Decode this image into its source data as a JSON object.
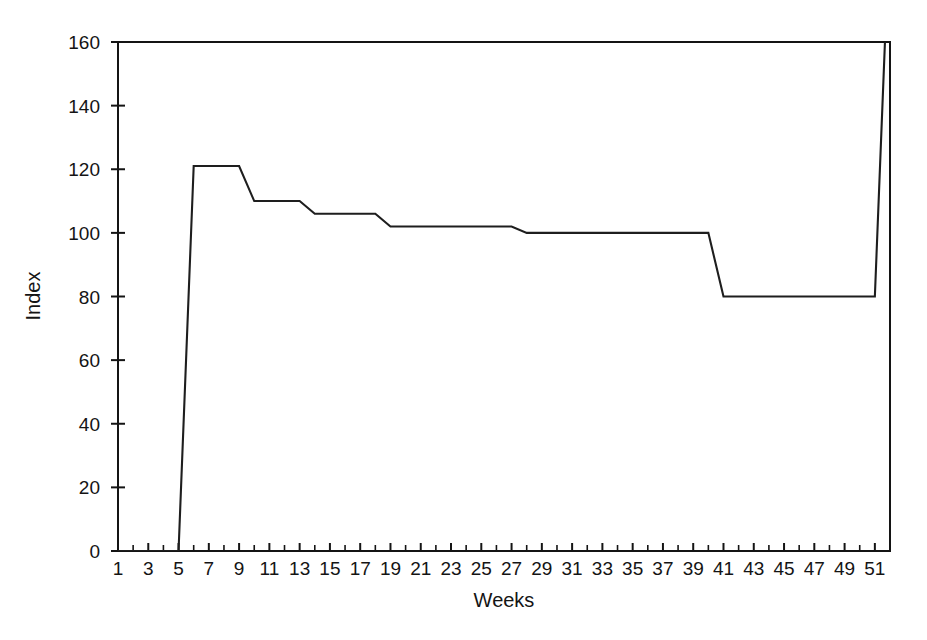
{
  "chart_data": {
    "type": "line",
    "title": "",
    "xlabel": "Weeks",
    "ylabel": "Index",
    "xlim": [
      1,
      52
    ],
    "ylim": [
      0,
      160
    ],
    "grid": false,
    "legend": null,
    "y_ticks": [
      0,
      20,
      40,
      60,
      80,
      100,
      120,
      140,
      160
    ],
    "y_tick_labels": [
      "0",
      "20",
      "40",
      "60",
      "80",
      "100",
      "120",
      "140",
      "160"
    ],
    "x_ticks": [
      1,
      2,
      3,
      4,
      5,
      6,
      7,
      8,
      9,
      10,
      11,
      12,
      13,
      14,
      15,
      16,
      17,
      18,
      19,
      20,
      21,
      22,
      23,
      24,
      25,
      26,
      27,
      28,
      29,
      30,
      31,
      32,
      33,
      34,
      35,
      36,
      37,
      38,
      39,
      40,
      41,
      42,
      43,
      44,
      45,
      46,
      47,
      48,
      49,
      50,
      51,
      52
    ],
    "x_tick_labels": [
      "1",
      "3",
      "5",
      "7",
      "9",
      "11",
      "13",
      "15",
      "17",
      "19",
      "21",
      "23",
      "25",
      "27",
      "29",
      "31",
      "33",
      "35",
      "37",
      "39",
      "41",
      "43",
      "45",
      "47",
      "49",
      "51"
    ],
    "x_labeled_ticks": [
      1,
      3,
      5,
      7,
      9,
      11,
      13,
      15,
      17,
      19,
      21,
      23,
      25,
      27,
      29,
      31,
      33,
      35,
      37,
      39,
      41,
      43,
      45,
      47,
      49,
      51
    ],
    "series": [
      {
        "name": "Index",
        "color": "#1e1e1e",
        "x": [
          1,
          2,
          3,
          4,
          5,
          6,
          7,
          8,
          9,
          10,
          11,
          12,
          13,
          14,
          15,
          16,
          17,
          18,
          19,
          20,
          21,
          22,
          23,
          24,
          25,
          26,
          27,
          28,
          29,
          30,
          31,
          32,
          33,
          34,
          35,
          36,
          37,
          38,
          39,
          40,
          41,
          42,
          43,
          44,
          45,
          46,
          47,
          48,
          49,
          50,
          51,
          52
        ],
        "values": [
          0,
          0,
          0,
          0,
          0,
          121,
          121,
          121,
          121,
          110,
          110,
          110,
          110,
          106,
          106,
          106,
          106,
          106,
          102,
          102,
          102,
          102,
          102,
          102,
          102,
          102,
          102,
          100,
          100,
          100,
          100,
          100,
          100,
          100,
          100,
          100,
          100,
          100,
          100,
          100,
          80,
          80,
          80,
          80,
          80,
          80,
          80,
          80,
          80,
          80,
          80,
          200
        ]
      }
    ]
  },
  "axes": {
    "x_axis_label": "Weeks",
    "y_axis_label": "Index"
  }
}
